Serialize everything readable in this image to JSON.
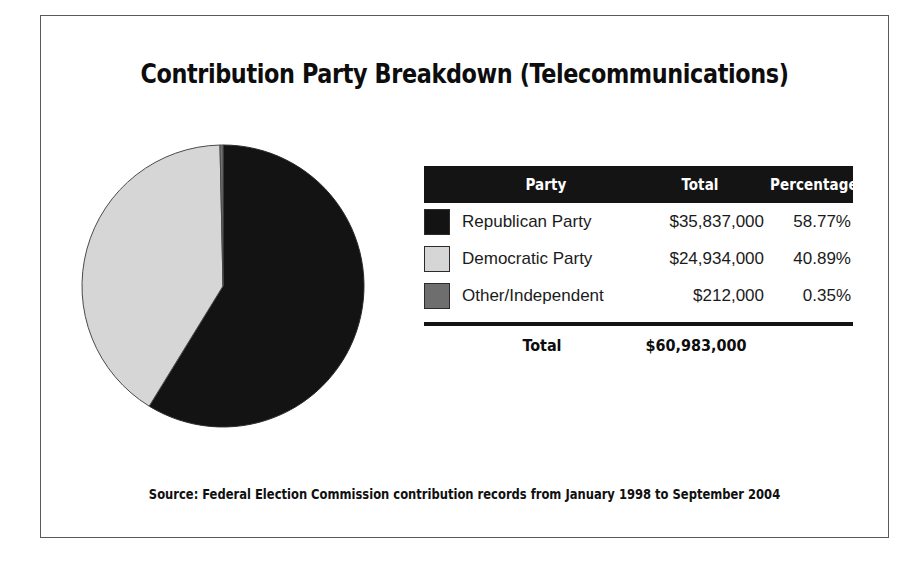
{
  "title": "Contribution Party Breakdown (Telecommunications)",
  "source_note": "Source: Federal Election Commission contribution records from January 1998 to September 2004",
  "table": {
    "headers": {
      "party": "Party",
      "total": "Total",
      "percentage": "Percentage"
    },
    "rows": [
      {
        "party": "Republican Party",
        "total": "$35,837,000",
        "percentage": "58.77%",
        "color": "#131313"
      },
      {
        "party": "Democratic Party",
        "total": "$24,934,000",
        "percentage": "40.89%",
        "color": "#d6d6d6"
      },
      {
        "party": "Other/Independent",
        "total": "$212,000",
        "percentage": "0.35%",
        "color": "#6e6e6e"
      }
    ],
    "total_row": {
      "label": "Total",
      "value": "$60,983,000"
    }
  },
  "chart_data": {
    "type": "pie",
    "title": "Contribution Party Breakdown (Telecommunications)",
    "categories": [
      "Republican Party",
      "Democratic Party",
      "Other/Independent"
    ],
    "values": [
      35837000,
      24934000,
      212000
    ],
    "percentages": [
      58.77,
      40.89,
      0.35
    ],
    "value_labels": [
      "$35,837,000",
      "$24,934,000",
      "$212,000"
    ],
    "percentage_labels": [
      "58.77%",
      "40.89%",
      "0.35%"
    ],
    "colors": [
      "#131313",
      "#d6d6d6",
      "#6e6e6e"
    ],
    "total_value": 60983000,
    "total_label": "$60,983,000",
    "legend": "right-table",
    "start_angle_deg": 0,
    "direction": "clockwise",
    "grid": false,
    "xlabel": "",
    "ylabel": ""
  }
}
